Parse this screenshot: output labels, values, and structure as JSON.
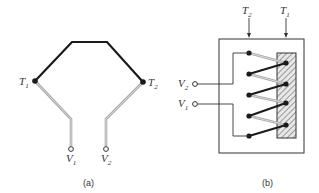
{
  "figure": {
    "panel_a": {
      "caption": "(a)",
      "junction_1": {
        "label": "T",
        "subscript": "1"
      },
      "junction_2": {
        "label": "T",
        "subscript": "2"
      },
      "terminal_1": {
        "label": "V",
        "subscript": "1"
      },
      "terminal_2": {
        "label": "V",
        "subscript": "2"
      }
    },
    "panel_b": {
      "caption": "(b)",
      "temp_2": {
        "label": "T",
        "subscript": "2"
      },
      "temp_1": {
        "label": "T",
        "subscript": "1"
      },
      "terminal_2": {
        "label": "V",
        "subscript": "2"
      },
      "terminal_1": {
        "label": "V",
        "subscript": "1"
      }
    },
    "colors": {
      "wire_dark": "#1a1a1a",
      "wire_light": "#a8a8a8",
      "outline": "#333333"
    }
  }
}
